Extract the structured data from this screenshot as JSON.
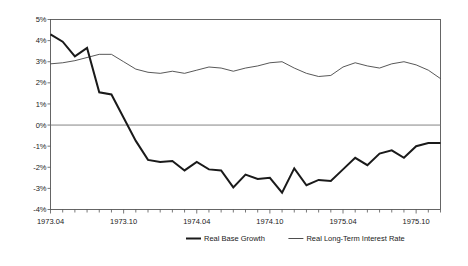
{
  "chart_data": {
    "type": "line",
    "title": "",
    "subtitle": "",
    "xlabel": "",
    "ylabel": "",
    "grid": false,
    "zero_line": true,
    "legend_position": "bottom",
    "ylim": [
      -4,
      5
    ],
    "ytick_labels": [
      "5%",
      "4%",
      "3%",
      "2%",
      "1%",
      "0%",
      "-1%",
      "-2%",
      "-3%",
      "-4%"
    ],
    "ytick_values": [
      5,
      4,
      3,
      2,
      1,
      0,
      -1,
      -2,
      -3,
      -4
    ],
    "xtick_labels": [
      "1973.04",
      "1973.10",
      "1974.04",
      "1974.10",
      "1975.04",
      "1975.10"
    ],
    "xtick_positions": [
      0,
      6,
      12,
      18,
      24,
      30
    ],
    "x": [
      "1973.04",
      "1973.05",
      "1973.06",
      "1973.07",
      "1973.08",
      "1973.09",
      "1973.10",
      "1973.11",
      "1973.12",
      "1974.01",
      "1974.02",
      "1974.03",
      "1974.04",
      "1974.05",
      "1974.06",
      "1974.07",
      "1974.08",
      "1974.09",
      "1974.10",
      "1974.11",
      "1974.12",
      "1975.01",
      "1975.02",
      "1975.03",
      "1975.04",
      "1975.05",
      "1975.06",
      "1975.07",
      "1975.08",
      "1975.09",
      "1975.10",
      "1975.11",
      "1975.12"
    ],
    "series": [
      {
        "name": "Real Base Growth",
        "style": "thick",
        "values": [
          4.3,
          3.95,
          3.25,
          3.65,
          1.55,
          1.45,
          0.35,
          -0.75,
          -1.65,
          -1.75,
          -1.7,
          -2.15,
          -1.75,
          -2.1,
          -2.15,
          -2.95,
          -2.35,
          -2.55,
          -2.5,
          -3.2,
          -2.05,
          -2.85,
          -2.6,
          -2.65,
          -2.1,
          -1.55,
          -1.9,
          -1.35,
          -1.2,
          -1.55,
          -1.0,
          -0.85,
          -0.85
        ]
      },
      {
        "name": "Real Long-Term Interest Rate",
        "style": "thin",
        "values": [
          2.9,
          2.95,
          3.05,
          3.2,
          3.35,
          3.35,
          3.0,
          2.65,
          2.5,
          2.45,
          2.55,
          2.45,
          2.6,
          2.75,
          2.7,
          2.55,
          2.7,
          2.8,
          2.95,
          3.0,
          2.7,
          2.45,
          2.3,
          2.35,
          2.75,
          2.95,
          2.8,
          2.7,
          2.9,
          3.0,
          2.85,
          2.6,
          2.2
        ]
      }
    ],
    "legend": [
      {
        "label": "Real Base Growth",
        "style": "thick",
        "color": "#1a1a1a"
      },
      {
        "label": "Real Long-Term Interest Rate",
        "style": "thin",
        "color": "#3a3a3a"
      }
    ],
    "colors": {
      "series_thick": "#1a1a1a",
      "series_thin": "#3a3a3a",
      "frame": "#555555",
      "zero_line": "#777777",
      "background": "#ffffff",
      "text": "#1a1a1a"
    }
  }
}
